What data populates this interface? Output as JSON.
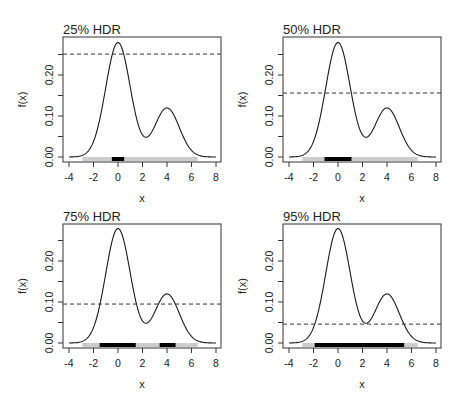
{
  "figure": {
    "width": 462,
    "height": 410
  },
  "chart_data": [
    {
      "type": "line",
      "title": "25% HDR",
      "xlabel": "x",
      "ylabel": "f(x)",
      "xlim": [
        -4.5,
        8.4
      ],
      "ylim": [
        0,
        0.28
      ],
      "x_ticks": [
        -4,
        -2,
        0,
        2,
        4,
        6,
        8
      ],
      "y_ticks": [
        0.0,
        0.05,
        0.1,
        0.15,
        0.2,
        0.25
      ],
      "y_tick_labels": [
        "0.00",
        "",
        "0.10",
        "",
        "0.20",
        ""
      ],
      "density": "0.7*N(0,1) + 0.3*N(4,1)",
      "threshold": 0.251,
      "hdr_intervals": [
        [
          -0.5,
          0.5
        ]
      ],
      "support_bar": [
        -2.9,
        6.5
      ],
      "grid": false
    },
    {
      "type": "line",
      "title": "50% HDR",
      "xlabel": "x",
      "ylabel": "f(x)",
      "xlim": [
        -4.5,
        8.4
      ],
      "ylim": [
        0,
        0.28
      ],
      "x_ticks": [
        -4,
        -2,
        0,
        2,
        4,
        6,
        8
      ],
      "y_ticks": [
        0.0,
        0.05,
        0.1,
        0.15,
        0.2,
        0.25
      ],
      "y_tick_labels": [
        "0.00",
        "",
        "0.10",
        "",
        "0.20",
        ""
      ],
      "density": "0.7*N(0,1) + 0.3*N(4,1)",
      "threshold": 0.156,
      "hdr_intervals": [
        [
          -1.1,
          1.1
        ]
      ],
      "support_bar": [
        -2.9,
        6.5
      ],
      "grid": false
    },
    {
      "type": "line",
      "title": "75% HDR",
      "xlabel": "x",
      "ylabel": "f(x)",
      "xlim": [
        -4.5,
        8.4
      ],
      "ylim": [
        0,
        0.28
      ],
      "x_ticks": [
        -4,
        -2,
        0,
        2,
        4,
        6,
        8
      ],
      "y_ticks": [
        0.0,
        0.05,
        0.1,
        0.15,
        0.2,
        0.25
      ],
      "y_tick_labels": [
        "0.00",
        "",
        "0.10",
        "",
        "0.20",
        ""
      ],
      "density": "0.7*N(0,1) + 0.3*N(4,1)",
      "threshold": 0.095,
      "hdr_intervals": [
        [
          -1.5,
          1.45
        ],
        [
          3.4,
          4.7
        ]
      ],
      "support_bar": [
        -2.9,
        6.5
      ],
      "grid": false
    },
    {
      "type": "line",
      "title": "95% HDR",
      "xlabel": "x",
      "ylabel": "f(x)",
      "xlim": [
        -4.5,
        8.4
      ],
      "ylim": [
        0,
        0.28
      ],
      "x_ticks": [
        -4,
        -2,
        0,
        2,
        4,
        6,
        8
      ],
      "y_ticks": [
        0.0,
        0.05,
        0.1,
        0.15,
        0.2,
        0.25
      ],
      "y_tick_labels": [
        "0.00",
        "",
        "0.10",
        "",
        "0.20",
        ""
      ],
      "density": "0.7*N(0,1) + 0.3*N(4,1)",
      "threshold": 0.046,
      "hdr_intervals": [
        [
          -1.9,
          5.4
        ]
      ],
      "support_bar": [
        -2.9,
        6.5
      ],
      "grid": false
    }
  ],
  "panels": [
    {
      "title": "25% HDR",
      "xlabel": "x",
      "ylabel": "f(x)",
      "box": [
        63,
        37,
        221,
        162
      ]
    },
    {
      "title": "50% HDR",
      "xlabel": "x",
      "ylabel": "f(x)",
      "box": [
        283,
        37,
        441,
        162
      ]
    },
    {
      "title": "75% HDR",
      "xlabel": "x",
      "ylabel": "f(x)",
      "box": [
        63,
        224,
        221,
        348
      ]
    },
    {
      "title": "95% HDR",
      "xlabel": "x",
      "ylabel": "f(x)",
      "box": [
        283,
        224,
        441,
        348
      ]
    }
  ],
  "colors": {
    "curve": "#1a1a1a",
    "hdr_bar": "#000000",
    "support_bar": "#cccccc",
    "threshold": "#333333",
    "axis": "#333333"
  }
}
